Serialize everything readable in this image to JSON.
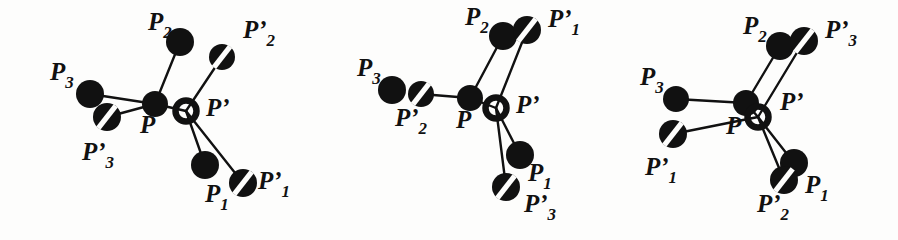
{
  "figure": {
    "type": "diagram",
    "panel_count": 3,
    "background_color": "#fdfdfc",
    "ink_color": "#111111",
    "node_legend": {
      "solid_node": "filled black disc",
      "open_node": "hollow black ring",
      "slashed_node": "black disc with white diagonal slash"
    }
  },
  "panels": [
    {
      "id": "panel-1",
      "center": {
        "p_label": "P",
        "p_prime_label": "P’"
      },
      "nodes": [
        {
          "name": "P",
          "style": "solid",
          "cx": 155,
          "cy": 104,
          "r": 13
        },
        {
          "name": "P-prime",
          "style": "open",
          "cx": 186,
          "cy": 111,
          "r": 14
        },
        {
          "name": "P2",
          "style": "solid",
          "cx": 180,
          "cy": 42,
          "r": 14
        },
        {
          "name": "P-prime-2",
          "style": "slashed",
          "cx": 222,
          "cy": 57,
          "r": 13
        },
        {
          "name": "P3",
          "style": "solid",
          "cx": 90,
          "cy": 94,
          "r": 14
        },
        {
          "name": "P-prime-3",
          "style": "slashed",
          "cx": 107,
          "cy": 117,
          "r": 14
        },
        {
          "name": "P1",
          "style": "solid",
          "cx": 205,
          "cy": 165,
          "r": 14
        },
        {
          "name": "P-prime-1",
          "style": "slashed",
          "cx": 243,
          "cy": 183,
          "r": 14
        }
      ],
      "edges": [
        {
          "from": "P",
          "to": "P2"
        },
        {
          "from": "P",
          "to": "P3"
        },
        {
          "from": "P",
          "to": "P-prime-3"
        },
        {
          "from": "P",
          "to": "P-prime"
        },
        {
          "from": "P-prime",
          "to": "P-prime-2"
        },
        {
          "from": "P-prime",
          "to": "P1"
        },
        {
          "from": "P-prime",
          "to": "P-prime-1"
        }
      ],
      "labels": [
        {
          "name": "label-P2",
          "base": "P",
          "sub": "2",
          "x": 148,
          "y": 30
        },
        {
          "name": "label-P-prime-2",
          "base": "P’",
          "sub": "2",
          "x": 243,
          "y": 38
        },
        {
          "name": "label-P3",
          "base": "P",
          "sub": "3",
          "x": 50,
          "y": 80
        },
        {
          "name": "label-P-prime-3",
          "base": "P’",
          "sub": "3",
          "x": 82,
          "y": 160
        },
        {
          "name": "label-P",
          "base": "P",
          "sub": "",
          "x": 140,
          "y": 133
        },
        {
          "name": "label-P-prime",
          "base": "P’",
          "sub": "",
          "x": 206,
          "y": 116
        },
        {
          "name": "label-P1",
          "base": "P",
          "sub": "1",
          "x": 205,
          "y": 202
        },
        {
          "name": "label-P-prime-1",
          "base": "P’",
          "sub": "1",
          "x": 258,
          "y": 189
        }
      ]
    },
    {
      "id": "panel-2",
      "center": {
        "p_label": "P",
        "p_prime_label": "P’"
      },
      "nodes": [
        {
          "name": "P",
          "style": "solid",
          "cx": 470,
          "cy": 98,
          "r": 13
        },
        {
          "name": "P-prime",
          "style": "open",
          "cx": 496,
          "cy": 108,
          "r": 14
        },
        {
          "name": "P2",
          "style": "solid",
          "cx": 503,
          "cy": 36,
          "r": 14
        },
        {
          "name": "P-prime-1",
          "style": "slashed",
          "cx": 527,
          "cy": 30,
          "r": 14
        },
        {
          "name": "P3",
          "style": "solid",
          "cx": 392,
          "cy": 90,
          "r": 14
        },
        {
          "name": "P-prime-2",
          "style": "slashed",
          "cx": 421,
          "cy": 94,
          "r": 13
        },
        {
          "name": "P1",
          "style": "solid",
          "cx": 520,
          "cy": 155,
          "r": 14
        },
        {
          "name": "P-prime-3",
          "style": "slashed",
          "cx": 506,
          "cy": 187,
          "r": 14
        }
      ],
      "edges": [
        {
          "from": "P",
          "to": "P2"
        },
        {
          "from": "P",
          "to": "P-prime-2"
        },
        {
          "from": "P",
          "to": "P-prime"
        },
        {
          "from": "P-prime",
          "to": "P-prime-1"
        },
        {
          "from": "P-prime",
          "to": "P1"
        },
        {
          "from": "P-prime",
          "to": "P-prime-3"
        }
      ],
      "labels": [
        {
          "name": "label-P2",
          "base": "P",
          "sub": "2",
          "x": 465,
          "y": 25
        },
        {
          "name": "label-P-prime-1",
          "base": "P’",
          "sub": "1",
          "x": 548,
          "y": 27
        },
        {
          "name": "label-P3",
          "base": "P",
          "sub": "3",
          "x": 357,
          "y": 76
        },
        {
          "name": "label-P-prime-2",
          "base": "P’",
          "sub": "2",
          "x": 395,
          "y": 126
        },
        {
          "name": "label-P",
          "base": "P",
          "sub": "",
          "x": 456,
          "y": 128
        },
        {
          "name": "label-P-prime",
          "base": "P’",
          "sub": "",
          "x": 516,
          "y": 113
        },
        {
          "name": "label-P1",
          "base": "P",
          "sub": "1",
          "x": 528,
          "y": 181
        },
        {
          "name": "label-P-prime-3",
          "base": "P’",
          "sub": "3",
          "x": 524,
          "y": 212
        }
      ]
    },
    {
      "id": "panel-3",
      "center": {
        "p_label": "P",
        "p_prime_label": "P’"
      },
      "nodes": [
        {
          "name": "P",
          "style": "solid",
          "cx": 746,
          "cy": 103,
          "r": 13
        },
        {
          "name": "P-prime",
          "style": "open",
          "cx": 758,
          "cy": 117,
          "r": 14
        },
        {
          "name": "P2",
          "style": "solid",
          "cx": 780,
          "cy": 46,
          "r": 14
        },
        {
          "name": "P-prime-3",
          "style": "slashed",
          "cx": 804,
          "cy": 41,
          "r": 14
        },
        {
          "name": "P3",
          "style": "solid",
          "cx": 676,
          "cy": 99,
          "r": 13
        },
        {
          "name": "P-prime-1",
          "style": "slashed",
          "cx": 673,
          "cy": 134,
          "r": 14
        },
        {
          "name": "P1",
          "style": "solid",
          "cx": 794,
          "cy": 163,
          "r": 14
        },
        {
          "name": "P-prime-2",
          "style": "slashed",
          "cx": 784,
          "cy": 180,
          "r": 14
        }
      ],
      "edges": [
        {
          "from": "P",
          "to": "P3"
        },
        {
          "from": "P",
          "to": "P2"
        },
        {
          "from": "P",
          "to": "P-prime"
        },
        {
          "from": "P-prime",
          "to": "P-prime-3"
        },
        {
          "from": "P-prime",
          "to": "P-prime-1"
        },
        {
          "from": "P-prime",
          "to": "P1"
        },
        {
          "from": "P-prime",
          "to": "P-prime-2"
        }
      ],
      "labels": [
        {
          "name": "label-P2",
          "base": "P",
          "sub": "2",
          "x": 743,
          "y": 34
        },
        {
          "name": "label-P-prime-3",
          "base": "P’",
          "sub": "3",
          "x": 825,
          "y": 38
        },
        {
          "name": "label-P3",
          "base": "P",
          "sub": "3",
          "x": 640,
          "y": 85
        },
        {
          "name": "label-P-prime-1",
          "base": "P’",
          "sub": "1",
          "x": 645,
          "y": 175
        },
        {
          "name": "label-P",
          "base": "P",
          "sub": "",
          "x": 726,
          "y": 134
        },
        {
          "name": "label-P-prime",
          "base": "P’",
          "sub": "",
          "x": 780,
          "y": 110
        },
        {
          "name": "label-P1",
          "base": "P",
          "sub": "1",
          "x": 805,
          "y": 193
        },
        {
          "name": "label-P-prime-2",
          "base": "P’",
          "sub": "2",
          "x": 757,
          "y": 212
        }
      ]
    }
  ]
}
